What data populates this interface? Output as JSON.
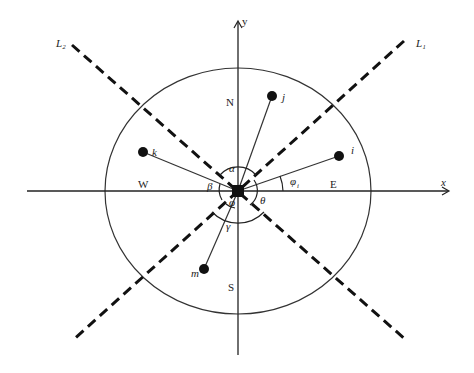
{
  "diagram": {
    "type": "coordinate-geometry",
    "axes": {
      "x_label": "x",
      "y_label": "y"
    },
    "directions": {
      "north": "N",
      "south": "S",
      "east": "E",
      "west": "W"
    },
    "lines": [
      {
        "id": "L1",
        "label": "L₁",
        "style": "dashed"
      },
      {
        "id": "L2",
        "label": "L₂",
        "style": "dashed"
      }
    ],
    "center_node": {
      "shape": "square"
    },
    "nodes": [
      {
        "id": "j",
        "label": "j"
      },
      {
        "id": "i",
        "label": "i"
      },
      {
        "id": "k",
        "label": "k"
      },
      {
        "id": "m",
        "label": "m"
      }
    ],
    "angles": {
      "alpha": "α",
      "beta": "β",
      "theta": "θ",
      "phi": "φ",
      "gamma": "γ",
      "phi_i": "φ",
      "phi_i_sub": "i"
    }
  }
}
